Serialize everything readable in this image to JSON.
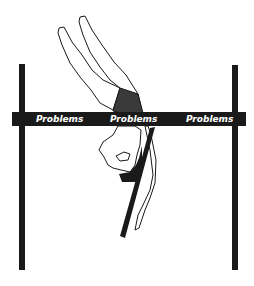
{
  "illustration": {
    "subject": "high-jumper clearing a bar",
    "bar": {
      "labels": [
        "Problems",
        "Problems",
        "Problems"
      ],
      "color": "#1a1a1a",
      "text_color": "#ffffff"
    },
    "poles": {
      "color": "#1a1a1a",
      "count": 2
    },
    "figure": {
      "outline_color": "#1a1a1a",
      "fill_shorts": "#3a3a3a"
    },
    "background": "#ffffff"
  }
}
